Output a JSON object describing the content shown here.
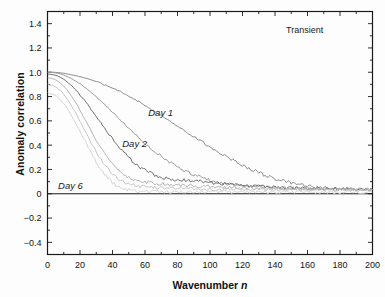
{
  "figure": {
    "panel_note": "Transient",
    "background": "#fdfdfd",
    "frame_color": "#1a1a1a"
  },
  "axis": {
    "x_title_main": "Wavenumber ",
    "x_title_italic": "n",
    "y_title": "Anomaly correlation"
  },
  "annotations": [
    {
      "text": "Day 1",
      "x": 62,
      "y": 0.66
    },
    {
      "text": "Day 2",
      "x": 46,
      "y": 0.4
    },
    {
      "text": "Day 6",
      "x": 6.5,
      "y": 0.055
    }
  ],
  "chart_data": {
    "type": "line",
    "title": "",
    "subtitle": "Transient",
    "xlabel": "Wavenumber n",
    "ylabel": "Anomaly correlation",
    "xlim": [
      0,
      200
    ],
    "ylim": [
      -0.5,
      1.5
    ],
    "xticks": [
      0,
      20,
      40,
      60,
      80,
      100,
      120,
      140,
      160,
      180,
      200
    ],
    "xtick_labels": [
      "0",
      "20",
      "40",
      "60",
      "80",
      "100",
      "120",
      "140",
      "160",
      "180",
      "200"
    ],
    "xminor_step": 10,
    "yticks": [
      -0.4,
      -0.2,
      0,
      0.2,
      0.4,
      0.6,
      0.8,
      1.0,
      1.2,
      1.4
    ],
    "ytick_labels": [
      "-0.4",
      "-0.2",
      "0",
      "0.2",
      "0.4",
      "0.6",
      "0.8",
      "1.0",
      "1.2",
      "1.4"
    ],
    "yminor_step": 0.1,
    "grid": false,
    "legend": "none",
    "zero_line": true,
    "series": [
      {
        "name": "Day 1",
        "color": "#8c8c8c",
        "x": [
          0,
          2,
          4,
          6,
          8,
          10,
          14,
          18,
          22,
          26,
          30,
          34,
          38,
          42,
          46,
          50,
          54,
          58,
          62,
          66,
          70,
          74,
          78,
          82,
          86,
          90,
          94,
          98,
          102,
          106,
          110,
          114,
          118,
          122,
          126,
          130,
          134,
          138,
          142,
          146,
          150,
          156,
          162,
          168,
          174,
          180,
          186,
          192,
          196,
          200
        ],
        "y": [
          1.0,
          1.0,
          1.0,
          0.998,
          0.995,
          0.991,
          0.981,
          0.97,
          0.957,
          0.941,
          0.923,
          0.903,
          0.881,
          0.857,
          0.831,
          0.803,
          0.774,
          0.743,
          0.711,
          0.678,
          0.644,
          0.61,
          0.575,
          0.54,
          0.505,
          0.47,
          0.436,
          0.402,
          0.369,
          0.337,
          0.306,
          0.277,
          0.249,
          0.222,
          0.197,
          0.174,
          0.153,
          0.134,
          0.117,
          0.101,
          0.088,
          0.072,
          0.06,
          0.051,
          0.045,
          0.041,
          0.038,
          0.036,
          0.035,
          0.034
        ]
      },
      {
        "name": "Day 2",
        "color": "#9a9a9a",
        "x": [
          0,
          2,
          4,
          6,
          8,
          10,
          14,
          18,
          22,
          26,
          30,
          34,
          38,
          42,
          46,
          50,
          54,
          58,
          62,
          66,
          70,
          74,
          78,
          82,
          86,
          90,
          94,
          98,
          102,
          106,
          110,
          116,
          122,
          130,
          140,
          150,
          160,
          175,
          190,
          200
        ],
        "y": [
          1.0,
          0.999,
          0.996,
          0.992,
          0.986,
          0.977,
          0.953,
          0.922,
          0.885,
          0.843,
          0.797,
          0.748,
          0.697,
          0.645,
          0.592,
          0.54,
          0.489,
          0.44,
          0.393,
          0.349,
          0.308,
          0.27,
          0.236,
          0.205,
          0.178,
          0.154,
          0.134,
          0.117,
          0.103,
          0.092,
          0.083,
          0.072,
          0.065,
          0.057,
          0.05,
          0.045,
          0.042,
          0.038,
          0.036,
          0.035
        ]
      },
      {
        "name": "Day 3",
        "color": "#6f6f6f",
        "x": [
          0,
          2,
          4,
          6,
          8,
          10,
          13,
          16,
          19,
          22,
          25,
          28,
          31,
          34,
          37,
          40,
          43,
          46,
          49,
          52,
          55,
          58,
          61,
          64,
          68,
          72,
          76,
          80,
          86,
          92,
          100,
          110,
          125,
          140,
          160,
          180,
          200
        ],
        "y": [
          0.985,
          0.983,
          0.978,
          0.97,
          0.958,
          0.942,
          0.912,
          0.874,
          0.83,
          0.781,
          0.728,
          0.673,
          0.617,
          0.561,
          0.506,
          0.453,
          0.403,
          0.356,
          0.313,
          0.274,
          0.24,
          0.21,
          0.185,
          0.164,
          0.142,
          0.128,
          0.12,
          0.118,
          0.11,
          0.104,
          0.092,
          0.08,
          0.064,
          0.053,
          0.044,
          0.039,
          0.036
        ]
      },
      {
        "name": "Day 4",
        "color": "#b5b5b5",
        "x": [
          0,
          2,
          4,
          6,
          8,
          10,
          12,
          14,
          17,
          20,
          23,
          26,
          29,
          32,
          35,
          38,
          41,
          44,
          48,
          52,
          56,
          60,
          66,
          72,
          80,
          90,
          100,
          115,
          130,
          150,
          170,
          200
        ],
        "y": [
          0.955,
          0.952,
          0.944,
          0.93,
          0.911,
          0.886,
          0.855,
          0.819,
          0.757,
          0.688,
          0.615,
          0.541,
          0.468,
          0.399,
          0.336,
          0.28,
          0.232,
          0.192,
          0.152,
          0.124,
          0.106,
          0.096,
          0.086,
          0.08,
          0.072,
          0.064,
          0.058,
          0.05,
          0.045,
          0.04,
          0.037,
          0.035
        ]
      },
      {
        "name": "Day 5",
        "color": "#c6c6c6",
        "x": [
          0,
          2,
          4,
          6,
          8,
          10,
          12,
          14,
          16,
          18,
          20,
          22,
          24,
          26,
          28,
          30,
          33,
          36,
          39,
          42,
          46,
          50,
          56,
          62,
          70,
          80,
          95,
          110,
          130,
          155,
          180,
          200
        ],
        "y": [
          0.9,
          0.896,
          0.886,
          0.87,
          0.847,
          0.818,
          0.783,
          0.742,
          0.697,
          0.648,
          0.597,
          0.545,
          0.492,
          0.44,
          0.39,
          0.342,
          0.278,
          0.222,
          0.175,
          0.138,
          0.1,
          0.078,
          0.062,
          0.054,
          0.048,
          0.043,
          0.039,
          0.036,
          0.034,
          0.032,
          0.031,
          0.03
        ]
      },
      {
        "name": "Day 6",
        "color": "#d4d4d4",
        "x": [
          0,
          2,
          4,
          6,
          8,
          10,
          12,
          14,
          16,
          18,
          20,
          22,
          24,
          26,
          28,
          30,
          32,
          35,
          38,
          42,
          46,
          52,
          60,
          70,
          85,
          100,
          120,
          145,
          170,
          200
        ],
        "y": [
          0.83,
          0.826,
          0.815,
          0.797,
          0.772,
          0.741,
          0.704,
          0.662,
          0.616,
          0.567,
          0.516,
          0.464,
          0.412,
          0.36,
          0.31,
          0.262,
          0.217,
          0.16,
          0.115,
          0.07,
          0.042,
          0.024,
          0.018,
          0.016,
          0.015,
          0.015,
          0.014,
          0.014,
          0.013,
          0.013
        ]
      }
    ]
  }
}
